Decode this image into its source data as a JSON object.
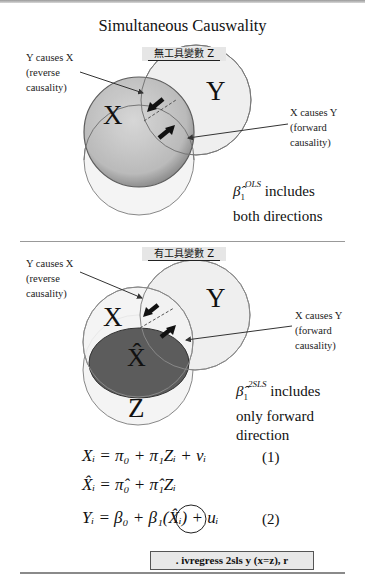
{
  "title": "Simultaneous Causwality",
  "top_panel": {
    "z_label": "無工具變數 Z",
    "reverse_note": [
      "Y causes X",
      "(reverse",
      "causality)"
    ],
    "forward_note": [
      "X causes Y",
      "(forward",
      "causality)"
    ],
    "circle_x": "X",
    "circle_y": "Y",
    "beta_symbol": "β̂",
    "beta_sub": "1",
    "beta_sup": "OLS",
    "beta_text_1": "includes",
    "beta_text_2": "both directions"
  },
  "bottom_panel": {
    "z_label": "有工具變數 Z",
    "reverse_note": [
      "Y causes X",
      "(reverse",
      "causality)"
    ],
    "forward_note": [
      "X causes Y",
      "(forward",
      "causality)"
    ],
    "circle_x": "X",
    "circle_y": "Y",
    "circle_z": "Z",
    "ellipse_xhat": "X̂",
    "beta_symbol": "β̂",
    "beta_sub": "1",
    "beta_sup": "2SLS",
    "beta_text_1": "includes",
    "beta_text_2": "only forward",
    "beta_text_3": "direction"
  },
  "equations": [
    {
      "text": "Xᵢ = π₀ + π₁Zᵢ + vᵢ",
      "number": "(1)"
    },
    {
      "text": "X̂ᵢ = π̂₀ + π̂₁Zᵢ",
      "number": ""
    },
    {
      "text": "Yᵢ = β₀ + β₁(X̂ᵢ) + uᵢ",
      "number": "(2)"
    }
  ],
  "command": ". ivregress 2sls y (x=z), r",
  "colors": {
    "x_circle_fill": "#bdbdbd",
    "xhat_ellipse_fill": "#5a5a5a",
    "light_circle_fill": "#f1f1f1",
    "label_bg": "#e6e6e6"
  }
}
